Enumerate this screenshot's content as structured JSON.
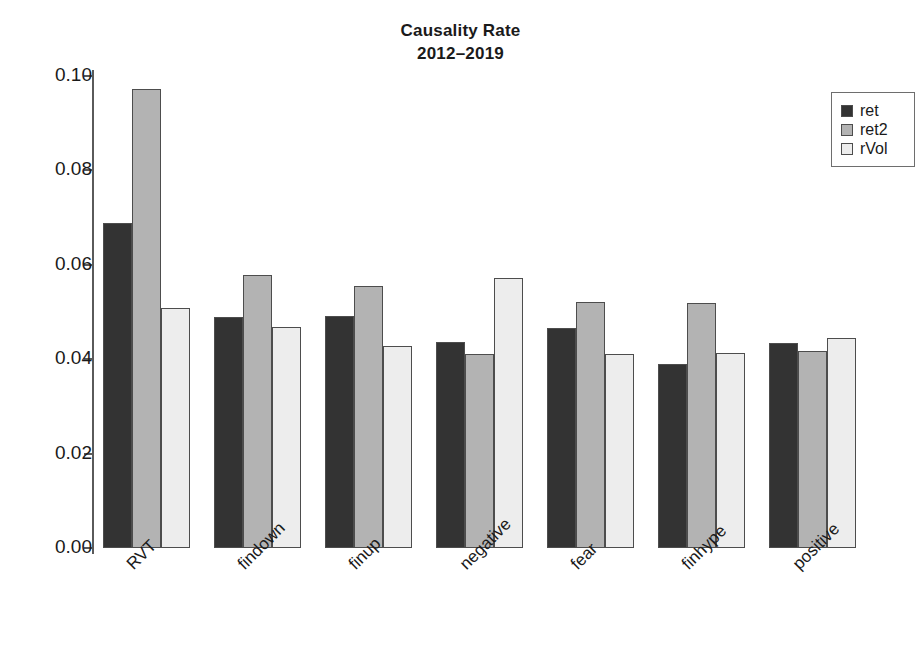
{
  "chart_data": {
    "type": "bar",
    "title": "Causality Rate",
    "subtitle": "2012–2019",
    "xlabel": "",
    "ylabel": "",
    "ylim": [
      0.0,
      0.1
    ],
    "grid": false,
    "legend_position": "top-right",
    "y_ticks": [
      "0.10",
      "0.08",
      "0.06",
      "0.04",
      "0.02",
      "0.00"
    ],
    "y_tick_values": [
      0.1,
      0.08,
      0.06,
      0.04,
      0.02,
      0.0
    ],
    "categories": [
      "RVT",
      "findown",
      "finup",
      "negative",
      "fear",
      "finhype",
      "positive"
    ],
    "series": [
      {
        "name": "ret",
        "color": "#333333",
        "values": [
          0.0688,
          0.049,
          0.0491,
          0.0437,
          0.0466,
          0.0389,
          0.0434
        ]
      },
      {
        "name": "ret2",
        "color": "#b3b3b3",
        "values": [
          0.0973,
          0.0578,
          0.0555,
          0.041,
          0.0521,
          0.052,
          0.0418
        ]
      },
      {
        "name": "rVol",
        "color": "#ededed",
        "values": [
          0.0508,
          0.0468,
          0.0427,
          0.0573,
          0.0412,
          0.0414,
          0.0444
        ]
      }
    ]
  },
  "legend": {
    "items": [
      {
        "label": "ret",
        "color": "#333333"
      },
      {
        "label": "ret2",
        "color": "#b3b3b3"
      },
      {
        "label": "rVol",
        "color": "#ededed"
      }
    ]
  },
  "axis": {
    "line_color": "#5a5a5a",
    "bar_border_color": "#4d4d4d"
  }
}
